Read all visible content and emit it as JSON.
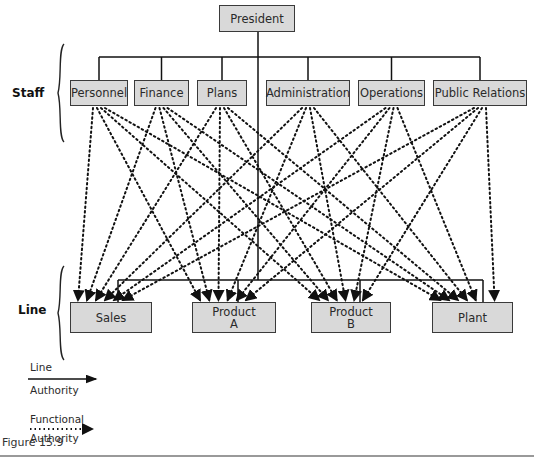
{
  "diagram": {
    "title_node": {
      "id": "president",
      "label": "President",
      "box": [
        219,
        5,
        76,
        27
      ]
    },
    "groups": {
      "staff_label": "Staff",
      "line_label": "Line"
    },
    "staff": [
      {
        "id": "personnel",
        "label": "Personnel",
        "box": [
          70,
          80,
          58,
          26
        ]
      },
      {
        "id": "finance",
        "label": "Finance",
        "box": [
          134,
          80,
          55,
          26
        ]
      },
      {
        "id": "plans",
        "label": "Plans",
        "box": [
          197,
          80,
          50,
          26
        ]
      },
      {
        "id": "administration",
        "label": "Administration",
        "box": [
          266,
          80,
          84,
          26
        ]
      },
      {
        "id": "operations",
        "label": "Operations",
        "box": [
          358,
          80,
          67,
          26
        ]
      },
      {
        "id": "public_relations",
        "label": "Public Relations",
        "box": [
          433,
          80,
          94,
          26
        ]
      }
    ],
    "line": [
      {
        "id": "sales",
        "label": "Sales",
        "box": [
          70,
          302,
          82,
          31
        ]
      },
      {
        "id": "product_a",
        "label": "Product\nA",
        "box": [
          192,
          302,
          84,
          31
        ]
      },
      {
        "id": "product_b",
        "label": "Product\nB",
        "box": [
          311,
          302,
          80,
          31
        ]
      },
      {
        "id": "plant",
        "label": "Plant",
        "box": [
          432,
          302,
          81,
          31
        ]
      }
    ],
    "line_authority_edges": [
      [
        "president",
        "personnel"
      ],
      [
        "president",
        "finance"
      ],
      [
        "president",
        "plans"
      ],
      [
        "president",
        "administration"
      ],
      [
        "president",
        "operations"
      ],
      [
        "president",
        "public_relations"
      ],
      [
        "president",
        "sales"
      ],
      [
        "president",
        "product_a"
      ],
      [
        "president",
        "product_b"
      ],
      [
        "president",
        "plant"
      ]
    ],
    "functional_authority_edges": "every staff unit -> every line unit (24 dotted arrows)"
  },
  "legend": {
    "line_authority": {
      "top": "Line",
      "bottom": "Authority",
      "style": "solid arrow"
    },
    "functional_authority": {
      "top": "Functional",
      "bottom": "Authority",
      "style": "dotted arrow"
    }
  },
  "caption": "Figure 15.9",
  "colors": {
    "box_fill": "#d9d9d9",
    "box_border": "#3a3a3a",
    "line": "#111111",
    "rule": "#999999"
  }
}
